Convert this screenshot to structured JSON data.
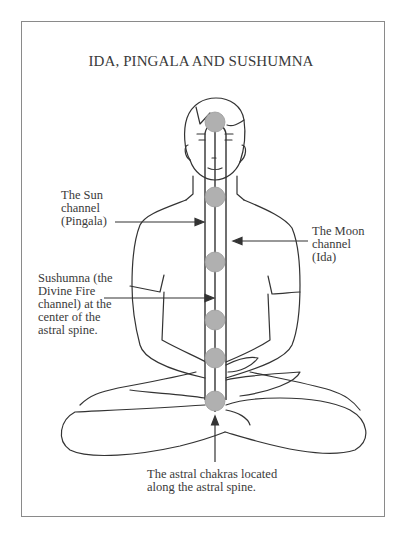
{
  "title": "IDA, PINGALA AND SUSHUMNA",
  "labels": {
    "sun": {
      "lines": [
        "The Sun",
        "channel",
        "(Pingala)"
      ]
    },
    "moon": {
      "lines": [
        "The Moon",
        "channel",
        "(Ida)"
      ]
    },
    "sushumna": {
      "lines": [
        "Sushumna (the",
        "Divine Fire",
        "channel) at the",
        "center of the",
        "astral spine."
      ]
    },
    "astral": {
      "lines": [
        "The astral chakras located",
        "along the astral spine."
      ]
    }
  },
  "figure": {
    "chakra_count": 6,
    "chakra_color": "#b0b0b0",
    "line_color": "#333333"
  }
}
